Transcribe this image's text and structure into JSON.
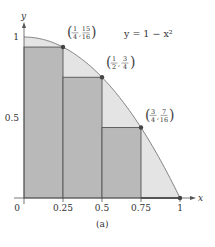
{
  "chart_data": {
    "type": "area",
    "title": "",
    "caption": "(a)",
    "xlabel": "x",
    "ylabel": "y",
    "xlim": [
      0,
      1
    ],
    "ylim": [
      0,
      1
    ],
    "curve": {
      "equation_label": "y = 1 − x²",
      "function": "1 - x^2"
    },
    "x_ticks": [
      {
        "value": 0,
        "label": "0"
      },
      {
        "value": 0.25,
        "label": "0.25"
      },
      {
        "value": 0.5,
        "label": "0.5"
      },
      {
        "value": 0.75,
        "label": "0.75"
      },
      {
        "value": 1,
        "label": "1"
      }
    ],
    "y_ticks": [
      {
        "value": 0.5,
        "label": "0.5"
      },
      {
        "value": 1,
        "label": "1"
      }
    ],
    "rectangles": [
      {
        "x0": 0,
        "x1": 0.25,
        "height": 0.9375
      },
      {
        "x0": 0.25,
        "x1": 0.5,
        "height": 0.75
      },
      {
        "x0": 0.5,
        "x1": 0.75,
        "height": 0.4375
      },
      {
        "x0": 0.75,
        "x1": 1,
        "height": 0
      }
    ],
    "points": [
      {
        "x": 0.25,
        "y": 0.9375,
        "label_x_num": "1",
        "label_x_den": "4",
        "label_y_num": "15",
        "label_y_den": "16"
      },
      {
        "x": 0.5,
        "y": 0.75,
        "label_x_num": "1",
        "label_x_den": "2",
        "label_y_num": "3",
        "label_y_den": "4"
      },
      {
        "x": 0.75,
        "y": 0.4375,
        "label_x_num": "3",
        "label_x_den": "4",
        "label_y_num": "7",
        "label_y_den": "16"
      },
      {
        "x": 1,
        "y": 0,
        "label_x_num": "",
        "label_x_den": "",
        "label_y_num": "",
        "label_y_den": ""
      }
    ],
    "colors": {
      "rect_fill": "#b9b9b9",
      "under_curve_fill": "#e4e4e4",
      "line": "#555555",
      "point": "#444444"
    }
  }
}
